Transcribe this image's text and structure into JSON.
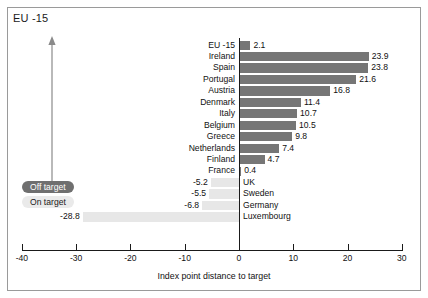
{
  "chart": {
    "title": "EU -15",
    "legend": {
      "off_target": "Off target",
      "on_target": "On target"
    },
    "colors": {
      "off_target_bar": "#767676",
      "on_target_bar": "#e7e7e7",
      "axis": "#1a1a1a",
      "frame": "#9a9a9a"
    }
  },
  "chart_data": {
    "type": "bar",
    "orientation": "horizontal",
    "title": "EU -15",
    "xlabel": "Index point distance to target",
    "ylabel": "",
    "xlim": [
      -40,
      30
    ],
    "xticks": [
      -40,
      -30,
      -20,
      -10,
      0,
      10,
      20,
      30
    ],
    "xtick_labels": [
      "-40",
      "-30",
      "-20",
      "-10",
      "0",
      "10",
      "20",
      "30"
    ],
    "grid": false,
    "legend_position": "left",
    "series": [
      {
        "name": "Off target",
        "color": "#767676"
      },
      {
        "name": "On target",
        "color": "#e7e7e7"
      }
    ],
    "categories": [
      "EU -15",
      "Ireland",
      "Spain",
      "Portugal",
      "Austria",
      "Denmark",
      "Italy",
      "Belgium",
      "Greece",
      "Netherlands",
      "Finland",
      "France",
      "UK",
      "Sweden",
      "Germany",
      "Luxembourg"
    ],
    "values": [
      2.1,
      23.9,
      23.8,
      21.6,
      16.8,
      11.4,
      10.7,
      10.5,
      9.8,
      7.4,
      4.7,
      0.4,
      -5.2,
      -5.5,
      -6.8,
      -28.8
    ],
    "value_labels": [
      "2.1",
      "23.9",
      "23.8",
      "21.6",
      "16.8",
      "11.4",
      "10.7",
      "10.5",
      "9.8",
      "7.4",
      "4.7",
      "0.4",
      "-5.2",
      "-5.5",
      "-6.8",
      "-28.8"
    ],
    "point_categories": [
      "off",
      "off",
      "off",
      "off",
      "off",
      "off",
      "off",
      "off",
      "off",
      "off",
      "off",
      "off",
      "on",
      "on",
      "on",
      "on"
    ]
  }
}
